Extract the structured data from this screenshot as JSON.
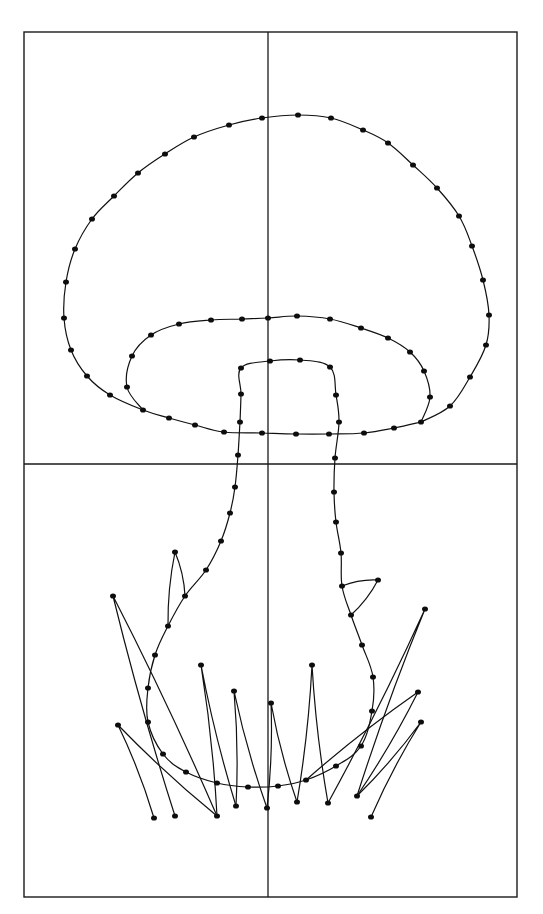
{
  "figure": {
    "colors": {
      "background": "#ffffff",
      "ink": "#111111"
    },
    "frame": {
      "x": 24,
      "y": 32,
      "width": 493,
      "height": 865
    },
    "grid": {
      "vertical_x": 268,
      "horizontal_y": 464
    },
    "dot_radius": 3,
    "paths": [
      {
        "name": "cap-outer",
        "points": [
          [
            421,
            422
          ],
          [
            450,
            406
          ],
          [
            470,
            377
          ],
          [
            486,
            345
          ],
          [
            489,
            315
          ],
          [
            483,
            280
          ],
          [
            472,
            246
          ],
          [
            459,
            216
          ],
          [
            437,
            188
          ],
          [
            413,
            165
          ],
          [
            388,
            143
          ],
          [
            363,
            130
          ],
          [
            331,
            118
          ],
          [
            298,
            115
          ],
          [
            262,
            118
          ],
          [
            229,
            125
          ],
          [
            194,
            137
          ],
          [
            165,
            154
          ],
          [
            138,
            173
          ],
          [
            114,
            196
          ],
          [
            92,
            219
          ],
          [
            75,
            249
          ],
          [
            66,
            282
          ],
          [
            64,
            318
          ],
          [
            71,
            350
          ],
          [
            87,
            376
          ],
          [
            110,
            395
          ],
          [
            143,
            410
          ],
          [
            169,
            418
          ],
          [
            195,
            425
          ],
          [
            224,
            432
          ],
          [
            262,
            433
          ],
          [
            296,
            434
          ],
          [
            329,
            434
          ],
          [
            364,
            433
          ],
          [
            394,
            428
          ],
          [
            421,
            422
          ]
        ]
      },
      {
        "name": "cap-gill",
        "points": [
          [
            143,
            410
          ],
          [
            127,
            387
          ],
          [
            132,
            356
          ],
          [
            151,
            335
          ],
          [
            179,
            324
          ],
          [
            211,
            320
          ],
          [
            242,
            319
          ],
          [
            268,
            318
          ],
          [
            297,
            316
          ],
          [
            330,
            319
          ],
          [
            361,
            328
          ],
          [
            388,
            338
          ],
          [
            410,
            352
          ],
          [
            424,
            371
          ],
          [
            430,
            397
          ],
          [
            421,
            422
          ]
        ]
      },
      {
        "name": "stem",
        "points": [
          [
            240,
            422
          ],
          [
            241,
            394
          ],
          [
            241,
            368
          ],
          [
            270,
            361
          ],
          [
            300,
            360
          ],
          [
            330,
            367
          ],
          [
            336,
            395
          ],
          [
            339,
            422
          ],
          [
            335,
            458
          ],
          [
            334,
            492
          ],
          [
            336,
            522
          ],
          [
            341,
            553
          ],
          [
            342,
            586
          ],
          [
            351,
            615
          ],
          [
            362,
            645
          ],
          [
            373,
            677
          ],
          [
            372,
            711
          ],
          [
            361,
            746
          ],
          [
            336,
            766
          ],
          [
            306,
            780
          ],
          [
            278,
            786
          ],
          [
            248,
            787
          ],
          [
            217,
            783
          ],
          [
            186,
            772
          ],
          [
            163,
            754
          ],
          [
            148,
            722
          ],
          [
            148,
            688
          ],
          [
            155,
            655
          ],
          [
            168,
            626
          ],
          [
            185,
            596
          ],
          [
            206,
            570
          ],
          [
            221,
            541
          ],
          [
            230,
            513
          ],
          [
            235,
            487
          ],
          [
            238,
            455
          ],
          [
            240,
            422
          ]
        ]
      },
      {
        "name": "grass-blade-1",
        "points": [
          [
            185,
            596
          ],
          [
            175,
            552
          ],
          [
            168,
            626
          ]
        ]
      },
      {
        "name": "grass-blade-2",
        "points": [
          [
            217,
            816
          ],
          [
            113,
            596
          ],
          [
            175,
            816
          ]
        ]
      },
      {
        "name": "grass-blade-3",
        "points": [
          [
            154,
            818
          ],
          [
            118,
            725
          ],
          [
            217,
            816
          ]
        ]
      },
      {
        "name": "grass-blade-4",
        "points": [
          [
            217,
            816
          ],
          [
            201,
            665
          ],
          [
            236,
            806
          ]
        ]
      },
      {
        "name": "grass-blade-5",
        "points": [
          [
            236,
            806
          ],
          [
            234,
            691
          ],
          [
            267,
            808
          ]
        ]
      },
      {
        "name": "grass-blade-6",
        "points": [
          [
            267,
            808
          ],
          [
            271,
            703
          ],
          [
            297,
            802
          ]
        ]
      },
      {
        "name": "grass-blade-7",
        "points": [
          [
            297,
            802
          ],
          [
            312,
            665
          ],
          [
            328,
            803
          ]
        ]
      },
      {
        "name": "grass-blade-8",
        "points": [
          [
            351,
            615
          ],
          [
            378,
            580
          ],
          [
            342,
            586
          ]
        ]
      },
      {
        "name": "grass-blade-9",
        "points": [
          [
            328,
            803
          ],
          [
            425,
            609
          ],
          [
            357,
            796
          ]
        ]
      },
      {
        "name": "grass-blade-10",
        "points": [
          [
            357,
            796
          ],
          [
            418,
            692
          ],
          [
            306,
            780
          ]
        ]
      },
      {
        "name": "grass-blade-11",
        "points": [
          [
            357,
            796
          ],
          [
            421,
            722
          ],
          [
            371,
            817
          ]
        ]
      }
    ]
  }
}
